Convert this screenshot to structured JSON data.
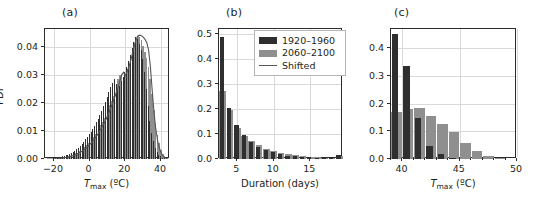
{
  "figure": {
    "panel_a_label": "(a)",
    "panel_b_label": "(b)",
    "panel_c_label": "(c)"
  },
  "legend": {
    "items": [
      {
        "label": "1920–1960",
        "style": "dark",
        "color": "#2f2f2f"
      },
      {
        "label": "2060–2100",
        "style": "gray",
        "color": "#8f8f8f"
      },
      {
        "label": "Shifted",
        "style": "line",
        "color": "#555555"
      }
    ]
  },
  "chart_data": [
    {
      "type": "area",
      "panel": "(a)",
      "title": "",
      "xlabel": "Tmax (ºC)",
      "ylabel": "PDF",
      "xlim": [
        -25,
        45
      ],
      "ylim": [
        0.0,
        0.0465
      ],
      "xticks": [
        -20,
        0,
        20,
        40
      ],
      "xtick_labels": [
        "−20",
        "0",
        "20",
        "40"
      ],
      "yticks": [
        0.0,
        0.01,
        0.02,
        0.03,
        0.04
      ],
      "ytick_labels": [
        "0.00",
        "0.01",
        "0.02",
        "0.03",
        "0.04"
      ],
      "grid": true,
      "legend_position": "none",
      "x": [
        -24,
        -23,
        -22,
        -21,
        -20,
        -19,
        -18,
        -17,
        -16,
        -15,
        -14,
        -13,
        -12,
        -11,
        -10,
        -9,
        -8,
        -7,
        -6,
        -5,
        -4,
        -3,
        -2,
        -1,
        0,
        1,
        2,
        3,
        4,
        5,
        6,
        7,
        8,
        9,
        10,
        11,
        12,
        13,
        14,
        15,
        16,
        17,
        18,
        19,
        20,
        21,
        22,
        23,
        24,
        25,
        26,
        27,
        28,
        29,
        30,
        31,
        32,
        33,
        34,
        35,
        36,
        37,
        38,
        39,
        40,
        41,
        42,
        43,
        44
      ],
      "series": [
        {
          "name": "1920–1960",
          "color": "#2f2f2f",
          "values": [
            0.0,
            0.0,
            0.0001,
            0.0001,
            0.0002,
            0.0003,
            0.0004,
            0.0005,
            0.0007,
            0.0009,
            0.0011,
            0.0013,
            0.0016,
            0.0019,
            0.0022,
            0.0026,
            0.003,
            0.0035,
            0.0041,
            0.0048,
            0.0055,
            0.0062,
            0.007,
            0.0079,
            0.0088,
            0.0098,
            0.0108,
            0.0119,
            0.0131,
            0.0144,
            0.0158,
            0.0173,
            0.0188,
            0.0204,
            0.0221,
            0.0239,
            0.0258,
            0.0272,
            0.0285,
            0.0268,
            0.0252,
            0.0262,
            0.0278,
            0.0295,
            0.0312,
            0.033,
            0.035,
            0.0372,
            0.0396,
            0.042,
            0.0437,
            0.0428,
            0.0412,
            0.039,
            0.0358,
            0.0312,
            0.0252,
            0.019,
            0.0136,
            0.0094,
            0.0063,
            0.0041,
            0.0026,
            0.0016,
            0.0009,
            0.0005,
            0.0002,
            0.0001,
            0.0
          ]
        },
        {
          "name": "2060–2100",
          "color": "#8f8f8f",
          "values": [
            0.0,
            0.0,
            0.0,
            0.0001,
            0.0001,
            0.0002,
            0.0002,
            0.0003,
            0.0004,
            0.0005,
            0.0007,
            0.0008,
            0.001,
            0.0012,
            0.0014,
            0.0017,
            0.002,
            0.0023,
            0.0027,
            0.0032,
            0.0037,
            0.0043,
            0.0049,
            0.0056,
            0.0063,
            0.0071,
            0.008,
            0.0089,
            0.0099,
            0.011,
            0.0122,
            0.0134,
            0.0147,
            0.0161,
            0.0176,
            0.0192,
            0.0209,
            0.0227,
            0.0246,
            0.0266,
            0.0287,
            0.0302,
            0.0296,
            0.029,
            0.0305,
            0.0322,
            0.0341,
            0.0362,
            0.0385,
            0.0408,
            0.0428,
            0.044,
            0.0436,
            0.0424,
            0.0406,
            0.0384,
            0.0362,
            0.033,
            0.0286,
            0.0232,
            0.0176,
            0.0126,
            0.0086,
            0.0056,
            0.0034,
            0.0019,
            0.001,
            0.0004,
            0.0001
          ]
        },
        {
          "name": "Shifted",
          "color": "#555555",
          "values": [
            0.0,
            0.0,
            0.0,
            0.0,
            0.0001,
            0.0001,
            0.0001,
            0.0002,
            0.0003,
            0.0004,
            0.0005,
            0.0006,
            0.0007,
            0.0009,
            0.0011,
            0.0013,
            0.0015,
            0.0018,
            0.0021,
            0.0025,
            0.0029,
            0.0034,
            0.0039,
            0.0045,
            0.0051,
            0.0058,
            0.0066,
            0.0074,
            0.0083,
            0.0093,
            0.0104,
            0.0115,
            0.0127,
            0.014,
            0.0154,
            0.0169,
            0.0185,
            0.0202,
            0.022,
            0.0239,
            0.0259,
            0.028,
            0.0302,
            0.031,
            0.03,
            0.0312,
            0.033,
            0.0352,
            0.0378,
            0.0406,
            0.0428,
            0.044,
            0.0443,
            0.0441,
            0.0436,
            0.0428,
            0.0416,
            0.039,
            0.033,
            0.025,
            0.017,
            0.011,
            0.0068,
            0.004,
            0.0022,
            0.0011,
            0.0005,
            0.0002,
            0.0
          ]
        }
      ]
    },
    {
      "type": "bar",
      "panel": "(b)",
      "title": "",
      "xlabel": "Duration (days)",
      "ylabel": "",
      "xlim": [
        2.5,
        19.5
      ],
      "ylim": [
        0.0,
        0.52
      ],
      "xticks": [
        5,
        10,
        15
      ],
      "xtick_labels": [
        "5",
        "10",
        "15"
      ],
      "yticks": [
        0.0,
        0.1,
        0.2,
        0.3,
        0.4,
        0.5
      ],
      "ytick_labels": [
        "0.0",
        "0.1",
        "0.2",
        "0.3",
        "0.4",
        "0.5"
      ],
      "grid": true,
      "legend_position": "upper right",
      "categories": [
        3,
        4,
        5,
        6,
        7,
        8,
        9,
        10,
        11,
        12,
        13,
        14,
        15,
        16,
        17,
        18,
        19
      ],
      "series": [
        {
          "name": "1920–1960",
          "color": "#2f2f2f",
          "values": [
            0.49,
            0.205,
            0.138,
            0.098,
            0.07,
            0.048,
            0.036,
            0.027,
            0.02,
            0.014,
            0.011,
            0.008,
            0.007,
            0.005,
            0.004,
            0.003,
            0.016
          ]
        },
        {
          "name": "2060–2100",
          "color": "#8f8f8f",
          "values": [
            0.272,
            0.196,
            0.124,
            0.093,
            0.072,
            0.055,
            0.042,
            0.033,
            0.026,
            0.02,
            0.015,
            0.012,
            0.01,
            0.008,
            0.006,
            0.005,
            0.012
          ]
        }
      ]
    },
    {
      "type": "bar",
      "panel": "(c)",
      "title": "",
      "xlabel": "Tmax (ºC)",
      "ylabel": "",
      "xlim": [
        39,
        50
      ],
      "ylim": [
        0.0,
        0.47
      ],
      "xticks": [
        40,
        45,
        50
      ],
      "xtick_labels": [
        "40",
        "45",
        "50"
      ],
      "yticks": [
        0.0,
        0.1,
        0.2,
        0.3,
        0.4
      ],
      "ytick_labels": [
        "0.0",
        "0.1",
        "0.2",
        "0.3",
        "0.4"
      ],
      "grid": true,
      "legend_position": "none",
      "categories": [
        39.5,
        40.5,
        41.5,
        42.5,
        43.5,
        44.5,
        45.5,
        46.5,
        47.5,
        48.5
      ],
      "series": [
        {
          "name": "1920–1960",
          "color": "#2f2f2f",
          "values": [
            0.452,
            0.335,
            0.148,
            0.046,
            0.017,
            0.004,
            0.001,
            0.0,
            0.0,
            0.0
          ]
        },
        {
          "name": "2060–2100",
          "color": "#8f8f8f",
          "values": [
            0.17,
            0.18,
            0.183,
            0.155,
            0.127,
            0.097,
            0.057,
            0.028,
            0.011,
            0.003
          ]
        }
      ]
    }
  ]
}
